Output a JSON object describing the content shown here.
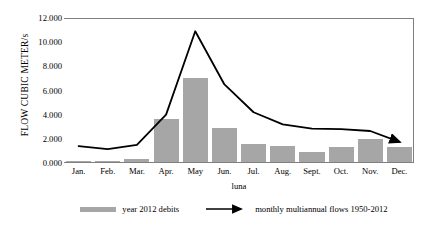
{
  "chart_data": {
    "type": "bar",
    "title": "",
    "xlabel": "luna",
    "ylabel": "FLOW CUBIC METER/s",
    "categories": [
      "Jan.",
      "Feb.",
      "Mar.",
      "Apr.",
      "May",
      "Jun.",
      "Jul.",
      "Aug.",
      "Sept.",
      "Oct.",
      "Nov.",
      "Dec."
    ],
    "ylim": [
      0,
      12
    ],
    "ytick_values": [
      0,
      2,
      4,
      6,
      8,
      10,
      12
    ],
    "ytick_labels": [
      "0.000",
      "2.000",
      "4.000",
      "6.000",
      "8.000",
      "10.000",
      "12.000"
    ],
    "grid": false,
    "legend_position": "bottom",
    "series": [
      {
        "name": "year 2012 debits",
        "type": "bar",
        "color": "#a6a6a6",
        "values": [
          0.2,
          0.2,
          0.35,
          3.65,
          7.0,
          2.9,
          1.55,
          1.4,
          0.9,
          1.35,
          1.95,
          1.3
        ]
      },
      {
        "name": "monthly multiannual flows 1950-2012",
        "type": "line",
        "color": "#000000",
        "values": [
          1.4,
          1.15,
          1.5,
          4.0,
          10.9,
          6.5,
          4.2,
          3.2,
          2.85,
          2.8,
          2.65,
          1.75
        ]
      }
    ]
  },
  "axes": {
    "y_title": "FLOW CUBIC METER/s",
    "x_title": "luna"
  },
  "legend": {
    "items": [
      {
        "label": "year 2012 debits",
        "marker": "bar-swatch"
      },
      {
        "label": "monthly multiannual flows 1950-2012",
        "marker": "arrow-line"
      }
    ]
  }
}
